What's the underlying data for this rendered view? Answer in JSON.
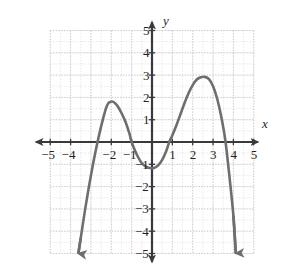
{
  "figure": {
    "background": "#ffffff",
    "curve_color": "#6e6e70",
    "axis_color": "#3a3a3c",
    "grid_color": "#d9d4d6",
    "label_color": "#231f20"
  },
  "axes": {
    "x_axis_label": "x",
    "y_axis_label": "y",
    "x_label_pos": {
      "left": 262,
      "top": 117
    },
    "y_label_pos": {
      "left": 163,
      "top": 14
    }
  },
  "chart_data": {
    "type": "line",
    "title": "",
    "xlabel": "x",
    "ylabel": "y",
    "xlim": [
      -5,
      5
    ],
    "ylim": [
      -5,
      5
    ],
    "grid": true,
    "grid_major_step": 1,
    "grid_minor_step": 0.5,
    "legend": "none",
    "xticks": [
      -5,
      -4,
      -2,
      -1,
      1,
      2,
      3,
      4,
      5
    ],
    "xtick_labels": [
      "−5",
      "−4",
      "−2",
      "−1",
      "1",
      "2",
      "3",
      "4",
      "5"
    ],
    "yticks": [
      5,
      4,
      3,
      2,
      1,
      -1,
      -2,
      -3,
      -4,
      -5
    ],
    "ytick_labels": [
      "5",
      "4",
      "3",
      "2",
      "1",
      "−1",
      "−2",
      "−3",
      "−4",
      "−5"
    ],
    "hidden_xtick_note": "−3 label is occluded by the curve",
    "series": [
      {
        "name": "quartic curve",
        "description": "Degree-4 polynomial with negative leading coefficient, W-shaped interior, both ends falling",
        "arrow_start": true,
        "arrow_end": true,
        "x": [
          -3.62,
          -3.5,
          -3.3,
          -3.1,
          -2.9,
          -2.7,
          -2.5,
          -2.3,
          -2.2,
          -2.1,
          -1.9,
          -1.7,
          -1.5,
          -1.3,
          -1.1,
          -1.05,
          -0.9,
          -0.7,
          -0.5,
          -0.3,
          -0.1,
          0.1,
          0.3,
          0.5,
          0.7,
          0.85,
          1.0,
          1.2,
          1.4,
          1.6,
          1.8,
          2.0,
          2.2,
          2.4,
          2.6,
          2.8,
          3.0,
          3.2,
          3.4,
          3.6,
          3.8,
          4.0,
          4.12
        ],
        "y": [
          -5.0,
          -4.3,
          -3.1,
          -2.0,
          -1.0,
          -0.1,
          0.7,
          1.4,
          1.65,
          1.78,
          1.8,
          1.62,
          1.3,
          0.9,
          0.35,
          0.15,
          -0.25,
          -0.65,
          -0.95,
          -1.1,
          -1.17,
          -1.17,
          -1.05,
          -0.8,
          -0.4,
          0.0,
          0.3,
          0.75,
          1.25,
          1.75,
          2.2,
          2.55,
          2.8,
          2.9,
          2.92,
          2.82,
          2.5,
          1.95,
          1.15,
          0.1,
          -1.5,
          -3.3,
          -5.0
        ],
        "key_points": {
          "local_maxima": [
            {
              "x": -2.0,
              "y": 1.8
            },
            {
              "x": 2.6,
              "y": 2.9
            }
          ],
          "local_minima": [
            {
              "x": 0.0,
              "y": -1.17
            }
          ],
          "x_intercepts": [
            -2.9,
            -1.05,
            0.85,
            3.6
          ],
          "y_intercept": -1.15
        }
      }
    ]
  }
}
